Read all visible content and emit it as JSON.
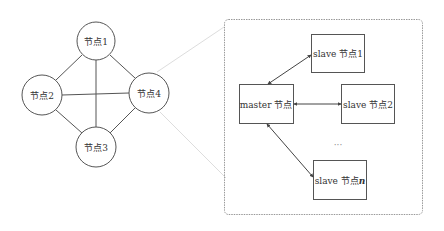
{
  "cluster": {
    "nodes": [
      {
        "id": "n1",
        "label": "节点1",
        "cx": 96,
        "cy": 41
      },
      {
        "id": "n2",
        "label": "节点2",
        "cx": 42,
        "cy": 95
      },
      {
        "id": "n4",
        "label": "节点4",
        "cx": 149,
        "cy": 93
      },
      {
        "id": "n3",
        "label": "节点3",
        "cx": 96,
        "cy": 147
      }
    ],
    "edges": [
      [
        "n1",
        "n2"
      ],
      [
        "n1",
        "n4"
      ],
      [
        "n1",
        "n3"
      ],
      [
        "n2",
        "n4"
      ],
      [
        "n2",
        "n3"
      ],
      [
        "n4",
        "n3"
      ]
    ]
  },
  "detail": {
    "master": {
      "label": "master 节点"
    },
    "slaves": [
      {
        "label_prefix": "slave 节点",
        "label_suffix": "1"
      },
      {
        "label_prefix": "slave 节点",
        "label_suffix": "2"
      },
      {
        "label_prefix": "slave 节点",
        "label_suffix": "n"
      }
    ],
    "ellipsis": "···"
  }
}
